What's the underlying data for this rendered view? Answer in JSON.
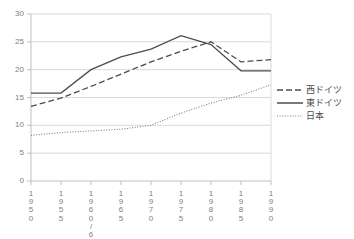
{
  "chart_data": {
    "type": "line",
    "title": "",
    "xlabel": "",
    "ylabel": "",
    "ylim": [
      0,
      30
    ],
    "ytick_step": 5,
    "grid": true,
    "legend_position": "right",
    "categories": [
      "1950",
      "1955",
      "1960/61",
      "1965",
      "1970",
      "1975",
      "1980",
      "1985",
      "1990"
    ],
    "yticks": [
      "30",
      "25",
      "20",
      "15",
      "10",
      "5",
      "0"
    ],
    "series": [
      {
        "name": "西ドイツ",
        "style": "dashed",
        "color": "#4d4d4d",
        "values": [
          13.4,
          14.9,
          17.0,
          19.2,
          21.4,
          23.3,
          25.0,
          21.4,
          21.8
        ]
      },
      {
        "name": "東ドイツ",
        "style": "solid",
        "color": "#4d4d4d",
        "values": [
          15.8,
          15.8,
          20.0,
          22.3,
          23.7,
          26.1,
          24.5,
          19.8,
          19.8
        ]
      },
      {
        "name": "日本",
        "style": "dotted",
        "color": "#808080",
        "values": [
          8.2,
          8.7,
          9.0,
          9.3,
          10.0,
          12.2,
          14.0,
          15.4,
          17.3
        ]
      }
    ]
  },
  "axis": {
    "tick_labels_y": [
      "30",
      "25",
      "20",
      "15",
      "10",
      "5",
      "0"
    ],
    "tick_labels_x": [
      "1950",
      "1955",
      "1960/61",
      "1965",
      "1970",
      "1975",
      "1980",
      "1985",
      "1990"
    ]
  },
  "legend": {
    "items": [
      {
        "label": "西ドイツ"
      },
      {
        "label": "東ドイツ"
      },
      {
        "label": "日本"
      }
    ]
  },
  "colors": {
    "grid": "#d9d9d9",
    "axis": "#bfbfbf",
    "line_dark": "#4d4d4d",
    "line_light": "#808080",
    "text": "#808080",
    "background": "#ffffff"
  }
}
